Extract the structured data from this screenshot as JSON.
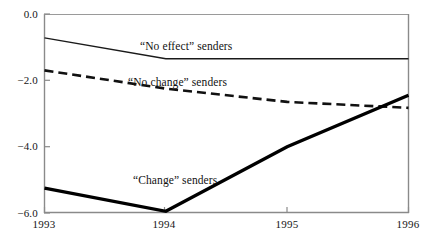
{
  "chart_data": {
    "type": "line",
    "title": "",
    "subtitle": "",
    "xlabel": "",
    "ylabel": "",
    "x": [
      1993,
      1994,
      1995,
      1996
    ],
    "xtick_labels": [
      "1993",
      "1994",
      "1995",
      "1996"
    ],
    "ytick_labels": [
      "0.0",
      "−2.0",
      "−4.0",
      "−6.0"
    ],
    "ytick_values": [
      0.0,
      -2.0,
      -4.0,
      -6.0
    ],
    "xlim": [
      1993,
      1996
    ],
    "ylim": [
      -6.0,
      0.0
    ],
    "grid": false,
    "legend_position": "inline-annotations",
    "series": [
      {
        "name": "“No effect” senders",
        "style": "thin-solid",
        "color": "#1a1a1a",
        "values": [
          -0.72,
          -1.35,
          -1.35,
          -1.35
        ]
      },
      {
        "name": "“No change” senders",
        "style": "dashed",
        "color": "#111111",
        "values": [
          -1.7,
          -2.25,
          -2.65,
          -2.83
        ]
      },
      {
        "name": "“Change” senders",
        "style": "thick-solid",
        "color": "#000000",
        "values": [
          -5.25,
          -5.95,
          -4.0,
          -2.45
        ]
      }
    ],
    "annotations": [
      {
        "text": "“No effect” senders",
        "x_px": 140,
        "y_px": 40
      },
      {
        "text": "“No change” senders",
        "x_px": 128,
        "y_px": 76
      },
      {
        "text": "“Change” senders",
        "x_px": 133,
        "y_px": 174
      }
    ],
    "axis_color": "#7a7a7a"
  },
  "axes": {
    "y_labels": [
      {
        "text": "0.0",
        "top": 8
      },
      {
        "text": "−2.0",
        "top": 74
      },
      {
        "text": "−4.0",
        "top": 140
      },
      {
        "text": "−6.0",
        "top": 207
      }
    ],
    "x_labels": [
      {
        "text": "1993",
        "left": 19
      },
      {
        "text": "1994",
        "left": 139
      },
      {
        "text": "1995",
        "left": 262
      },
      {
        "text": "1996",
        "left": 383
      }
    ]
  }
}
